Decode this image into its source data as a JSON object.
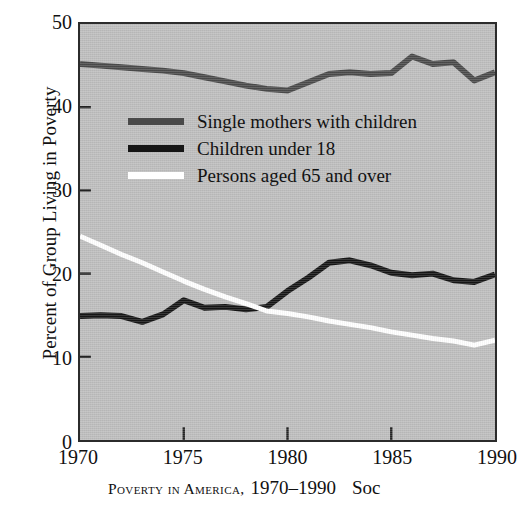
{
  "chart_data": {
    "type": "line",
    "xlabel": "",
    "ylabel": "Percent of Group Living in Poverty",
    "xlim": [
      1970,
      1990
    ],
    "ylim": [
      0,
      50
    ],
    "grid": false,
    "legend_position": "upper-left-inside",
    "plot_background": "#bdbdbd",
    "x_ticks": [
      1970,
      1975,
      1980,
      1985,
      1990
    ],
    "x_tick_labels": [
      "1970",
      "1975",
      "1980",
      "1985",
      "1990"
    ],
    "y_ticks": [
      0,
      10,
      20,
      30,
      40,
      50
    ],
    "y_tick_labels": [
      "0",
      "10",
      "20",
      "30",
      "40",
      "50"
    ],
    "x": [
      1970,
      1971,
      1972,
      1973,
      1974,
      1975,
      1976,
      1977,
      1978,
      1979,
      1980,
      1981,
      1982,
      1983,
      1984,
      1985,
      1986,
      1987,
      1988,
      1989,
      1990
    ],
    "series": [
      {
        "name": "Single mothers with children",
        "color": "#4a4a4a",
        "values": [
          45.2,
          45.0,
          44.8,
          44.6,
          44.4,
          44.1,
          43.6,
          43.1,
          42.6,
          42.2,
          42.0,
          43.0,
          44.0,
          44.2,
          44.0,
          44.1,
          46.1,
          45.2,
          45.4,
          43.2,
          44.2
        ]
      },
      {
        "name": "Children under 18",
        "color": "#161616",
        "values": [
          14.9,
          15.0,
          14.9,
          14.2,
          15.1,
          16.8,
          15.9,
          16.0,
          15.7,
          16.0,
          17.9,
          19.5,
          21.3,
          21.6,
          21.0,
          20.1,
          19.8,
          20.0,
          19.2,
          19.0,
          19.9
        ]
      },
      {
        "name": "Persons aged 65 and over",
        "color": "#ffffff",
        "values": [
          24.5,
          23.4,
          22.3,
          21.3,
          20.2,
          19.1,
          18.1,
          17.2,
          16.4,
          15.5,
          15.2,
          14.8,
          14.3,
          13.9,
          13.5,
          13.0,
          12.6,
          12.2,
          11.9,
          11.4,
          12.0
        ]
      }
    ]
  },
  "axes": {
    "y_title": "Percent of Group Living in Poverty",
    "y_tick_labels": [
      "50",
      "40",
      "30",
      "20",
      "10",
      "0"
    ],
    "x_tick_labels": [
      "1970",
      "1975",
      "1980",
      "1985",
      "1990"
    ]
  },
  "legend": {
    "items": [
      {
        "label": "Single mothers with children",
        "color": "#4a4a4a"
      },
      {
        "label": "Children under 18",
        "color": "#161616"
      },
      {
        "label": "Persons aged 65 and over",
        "color": "#ffffff"
      }
    ]
  },
  "caption": {
    "smallcaps": "Poverty in America,",
    "years": "1970–1990",
    "trailing": "Soc"
  }
}
